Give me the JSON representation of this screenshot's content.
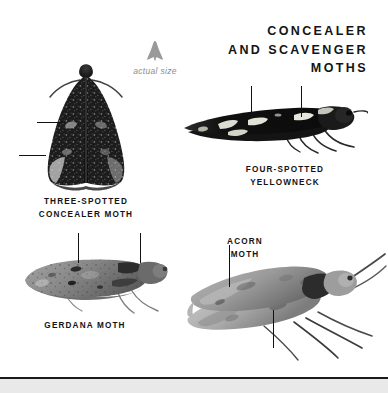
{
  "page": {
    "background_color": "#ffffff",
    "text_color": "#141414",
    "rule_color": "#1a1a1a",
    "strip_color": "#e9e9e9"
  },
  "headline": {
    "line1": "CONCEALER",
    "line2": "AND SCAVENGER",
    "line3": "MOTHS"
  },
  "actual_size": {
    "label": "actual size",
    "glyph_color": "#9a9a9a",
    "icon": "moth-silhouette-icon"
  },
  "specimens": [
    {
      "id": "three-spotted-concealer-moth",
      "caption_line1": "THREE-SPOTTED",
      "caption_line2": "CONCEALER MOTH",
      "body_color": "#1c1c1c",
      "pattern": "dark mottled triangular wings with pale speckles",
      "leader_lines": 2
    },
    {
      "id": "four-spotted-yellowneck",
      "caption_line1": "FOUR-SPOTTED",
      "caption_line2": "YELLOWNECK",
      "body_color": "#161616",
      "pattern": "elongated black wing with four pale blotches",
      "leader_lines": 2
    },
    {
      "id": "gerdana-moth",
      "caption_line1": "GERDANA MOTH",
      "caption_line2": "",
      "body_color": "#8d8d8d",
      "pattern": "grey elongated wing with dark speckles",
      "leader_lines": 2
    },
    {
      "id": "acorn-moth",
      "caption_line1": "ACORN",
      "caption_line2": "MOTH",
      "body_color": "#a5a5a5",
      "pattern": "pale grey narrow wings with long swept antennae",
      "leader_lines": 2
    }
  ]
}
